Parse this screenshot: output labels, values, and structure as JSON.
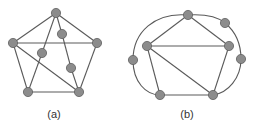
{
  "figures": [
    {
      "id": "a",
      "caption": "(a)",
      "caption_pos": [
        54,
        118
      ],
      "nodes": [
        {
          "id": "top",
          "x": 56,
          "y": 13
        },
        {
          "id": "left",
          "x": 13,
          "y": 43
        },
        {
          "id": "right",
          "x": 97,
          "y": 43
        },
        {
          "id": "bottom-left",
          "x": 28,
          "y": 92
        },
        {
          "id": "bottom-right",
          "x": 79,
          "y": 92
        },
        {
          "id": "inner-1",
          "x": 62,
          "y": 34
        },
        {
          "id": "inner-2",
          "x": 42,
          "y": 53
        },
        {
          "id": "inner-3",
          "x": 71,
          "y": 68
        }
      ],
      "edges": [
        [
          "top",
          "left"
        ],
        [
          "top",
          "right"
        ],
        [
          "left",
          "right"
        ],
        [
          "left",
          "bottom-left"
        ],
        [
          "right",
          "bottom-right"
        ],
        [
          "bottom-left",
          "bottom-right"
        ],
        [
          "left",
          "bottom-right"
        ],
        [
          "top",
          "inner-2"
        ],
        [
          "inner-2",
          "bottom-left"
        ],
        [
          "top",
          "inner-1"
        ],
        [
          "inner-1",
          "inner-3"
        ],
        [
          "inner-3",
          "bottom-right"
        ]
      ],
      "curves": []
    },
    {
      "id": "b",
      "caption": "(b)",
      "caption_pos": [
        187,
        118
      ],
      "nodes": [
        {
          "id": "top",
          "x": 188,
          "y": 15
        },
        {
          "id": "upper-right",
          "x": 225,
          "y": 23
        },
        {
          "id": "left",
          "x": 147,
          "y": 46
        },
        {
          "id": "right",
          "x": 229,
          "y": 46
        },
        {
          "id": "far-left",
          "x": 133,
          "y": 60
        },
        {
          "id": "far-right",
          "x": 241,
          "y": 59
        },
        {
          "id": "bottom-left",
          "x": 160,
          "y": 95
        },
        {
          "id": "bottom-right",
          "x": 213,
          "y": 95
        }
      ],
      "edges": [
        [
          "top",
          "left"
        ],
        [
          "top",
          "right"
        ],
        [
          "left",
          "right"
        ],
        [
          "left",
          "bottom-left"
        ],
        [
          "left",
          "bottom-right"
        ],
        [
          "right",
          "bottom-right"
        ],
        [
          "bottom-left",
          "bottom-right"
        ]
      ],
      "curves": [
        "M188,15 C155,12 133,32 133,60",
        "M133,60 C133,82 146,95 160,95",
        "M188,15 C205,14 218,17 225,23",
        "M225,23 C236,32 241,44 241,59",
        "M241,59 C241,78 228,93 213,95"
      ]
    }
  ],
  "colors": {
    "node_fill": "#8c8c8c",
    "node_stroke": "#606060",
    "edge": "#5a5a5a",
    "background": "#ffffff"
  }
}
